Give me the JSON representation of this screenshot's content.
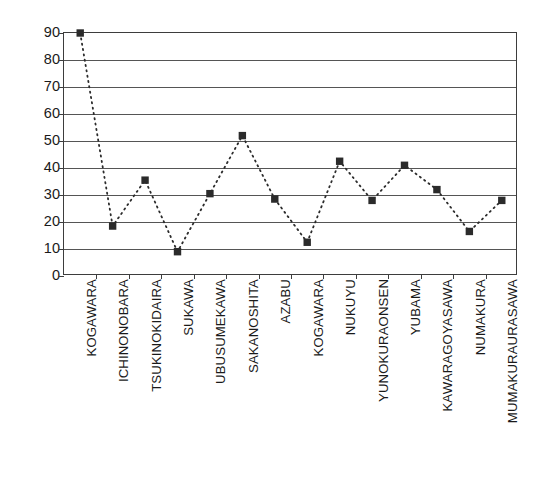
{
  "chart_data": {
    "type": "line",
    "title": "",
    "xlabel": "",
    "ylabel": "Angle (°)",
    "ylim": [
      0,
      90
    ],
    "ytick_step": 10,
    "yticks": [
      90,
      80,
      70,
      60,
      50,
      40,
      30,
      20,
      10,
      0
    ],
    "grid": true,
    "legend": "none",
    "marker": "filled-square",
    "linestyle": "dotted",
    "series_color": "#2b2b2b",
    "categories": [
      "KOGAWARA",
      "ICHINONOBARA",
      "TSUKINOKIDAIRA",
      "SUKAWA",
      "UBUSUMEKAWA",
      "SAKANOSHITA",
      "AZABU",
      "KOGAWARA",
      "NUKUYU",
      "YUNOKURAONSEN",
      "YUBAMA",
      "KAWARAGOYASAWA",
      "NUMAKURA",
      "MUMAKURAURASAWA"
    ],
    "values": [
      90,
      18.5,
      35.5,
      9,
      30.5,
      52,
      28.5,
      12.5,
      42.5,
      28,
      41,
      32,
      16.5,
      28
    ]
  },
  "axis": {
    "y_title": "Angle (°)"
  }
}
